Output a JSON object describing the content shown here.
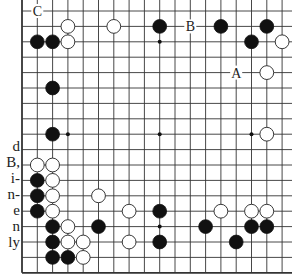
{
  "diagram": {
    "grid": {
      "origin_x": 22,
      "origin_y": 11,
      "spacing_x": 15.3,
      "spacing_y": 15.4,
      "cols": 18,
      "rows": 18,
      "extend_right_px": 12,
      "extend_top_px": 11,
      "line_color": "#333333",
      "edge_left": true,
      "edge_bottom": true
    },
    "star_points": [
      [
        3,
        2
      ],
      [
        9,
        2
      ],
      [
        15,
        2
      ],
      [
        3,
        8
      ],
      [
        9,
        8
      ],
      [
        15,
        8
      ],
      [
        3,
        14
      ],
      [
        9,
        14
      ],
      [
        15,
        14
      ]
    ],
    "black_stones": [
      [
        9,
        1
      ],
      [
        13,
        1
      ],
      [
        16,
        1
      ],
      [
        1,
        2
      ],
      [
        2,
        2
      ],
      [
        15,
        2
      ],
      [
        2,
        5
      ],
      [
        2,
        8
      ],
      [
        1,
        11
      ],
      [
        1,
        12
      ],
      [
        1,
        13
      ],
      [
        9,
        13
      ],
      [
        2,
        14
      ],
      [
        5,
        14
      ],
      [
        12,
        14
      ],
      [
        15,
        14
      ],
      [
        16,
        14
      ],
      [
        2,
        15
      ],
      [
        9,
        15
      ],
      [
        14,
        15
      ],
      [
        2,
        16
      ],
      [
        3,
        16
      ]
    ],
    "white_stones": [
      [
        3,
        1
      ],
      [
        6,
        1
      ],
      [
        3,
        2
      ],
      [
        17,
        2
      ],
      [
        16,
        4
      ],
      [
        16,
        8
      ],
      [
        1,
        10
      ],
      [
        2,
        10
      ],
      [
        2,
        11
      ],
      [
        2,
        12
      ],
      [
        5,
        12
      ],
      [
        2,
        13
      ],
      [
        7,
        13
      ],
      [
        13,
        13
      ],
      [
        15,
        13
      ],
      [
        16,
        13
      ],
      [
        3,
        14
      ],
      [
        3,
        15
      ],
      [
        4,
        15
      ],
      [
        7,
        15
      ],
      [
        4,
        16
      ]
    ],
    "labels": [
      {
        "text": "C",
        "col": 1,
        "row": 0
      },
      {
        "text": "B",
        "col": 11,
        "row": 1
      },
      {
        "text": "A",
        "col": 14,
        "row": 4
      }
    ],
    "stone_colors": {
      "black": "#111111",
      "white": "#ffffff",
      "outline": "#222222"
    }
  },
  "side_text": {
    "lines": [
      "d",
      "B,",
      "i-",
      "n-",
      "e",
      "n",
      "ly"
    ],
    "top_y": 138
  }
}
